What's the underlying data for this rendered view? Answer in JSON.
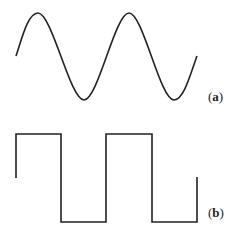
{
  "figure": {
    "panels": [
      {
        "id": "a",
        "label_open": "(",
        "label_letter": "a",
        "label_close": ")",
        "waveform": "sine",
        "description": "Sine wave, two full periods",
        "stroke": "#222222"
      },
      {
        "id": "b",
        "label_open": "(",
        "label_letter": "b",
        "label_close": ")",
        "waveform": "square",
        "description": "Square wave, two full periods",
        "stroke": "#222222"
      }
    ]
  }
}
